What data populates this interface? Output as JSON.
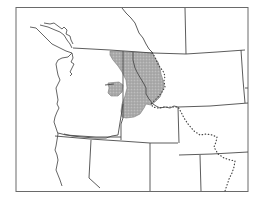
{
  "map": {
    "title": "",
    "region": "Pacific Northwest / Northern Rocky Mountains",
    "colors": {
      "background": "#ffffff",
      "border": "#4a4a4a",
      "range_fill": "#a8a8a8",
      "range_stipple": "#8c8c8c",
      "divide": "#444444"
    },
    "layers": [
      {
        "id": "frame",
        "label": "Map frame"
      },
      {
        "id": "coastline",
        "label": "Pacific coastline and Puget Sound"
      },
      {
        "id": "state-borders",
        "label": "State and international borders"
      },
      {
        "id": "range",
        "label": "Shaded distribution range",
        "style": "stippled gray"
      },
      {
        "id": "range-outlier",
        "label": "Isolated range patch (northeastern Oregon)",
        "style": "stippled gray"
      },
      {
        "id": "continental-divide",
        "label": "Dotted line",
        "style": "dotted"
      }
    ]
  }
}
